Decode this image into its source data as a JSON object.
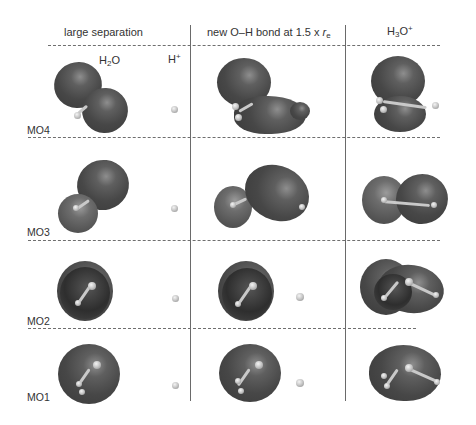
{
  "figure": {
    "columns": [
      {
        "label": "large separation"
      },
      {
        "label_prefix": "new O–H bond at  1.5 x ",
        "label_var": "r",
        "label_sub": "e"
      },
      {
        "label_main": "H",
        "label_sub": "3",
        "label_rest": "O",
        "label_sup": "+"
      }
    ],
    "species": {
      "water": {
        "main": "H",
        "sub": "2",
        "rest": "O"
      },
      "proton": {
        "main": "H",
        "sup": "+"
      }
    },
    "rows": [
      {
        "label": "MO4"
      },
      {
        "label": "MO3"
      },
      {
        "label": "MO2"
      },
      {
        "label": "MO1"
      }
    ],
    "colors": {
      "orbital_fill": "#474747",
      "atom_fill": "#c9c9c9",
      "line": "#6a6a6a",
      "text": "#333333"
    }
  }
}
